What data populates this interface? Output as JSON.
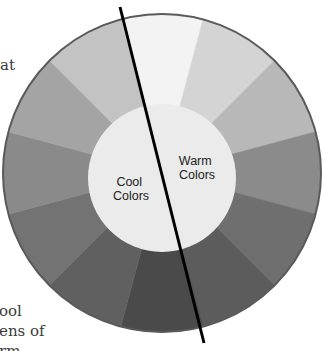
{
  "diagram": {
    "center": {
      "x": 162,
      "y": 173
    },
    "outer_radius": 159,
    "inner_circle": {
      "cx": 162,
      "cy": 178,
      "r": 74,
      "fill": "#ebebeb"
    },
    "rim_color": "#5a5a5a",
    "divider_line": {
      "x1": 120,
      "y1": 7,
      "x2": 204,
      "y2": 343,
      "color": "#000000"
    },
    "labels": {
      "cool": {
        "line1": "Cool",
        "line2": "Colors"
      },
      "warm": {
        "line1": "Warm",
        "line2": "Colors"
      }
    },
    "segments": [
      {
        "start_deg": -15,
        "end_deg": 15,
        "fill": "#f3f3f3"
      },
      {
        "start_deg": 15,
        "end_deg": 45,
        "fill": "#d4d4d4"
      },
      {
        "start_deg": 45,
        "end_deg": 75,
        "fill": "#b8b8b8"
      },
      {
        "start_deg": 75,
        "end_deg": 105,
        "fill": "#8b8b8b"
      },
      {
        "start_deg": 105,
        "end_deg": 135,
        "fill": "#6f6f6f"
      },
      {
        "start_deg": 135,
        "end_deg": 165,
        "fill": "#5c5c5c"
      },
      {
        "start_deg": 165,
        "end_deg": 195,
        "fill": "#4a4a4a"
      },
      {
        "start_deg": 195,
        "end_deg": 225,
        "fill": "#606060"
      },
      {
        "start_deg": 225,
        "end_deg": 255,
        "fill": "#737373"
      },
      {
        "start_deg": 255,
        "end_deg": 285,
        "fill": "#8a8a8a"
      },
      {
        "start_deg": 285,
        "end_deg": 315,
        "fill": "#a4a4a4"
      },
      {
        "start_deg": 315,
        "end_deg": 345,
        "fill": "#c3c3c3"
      }
    ]
  },
  "side_text": {
    "top_fragment": "at",
    "bottom_fragments": [
      "ool",
      "ens of",
      "rm"
    ]
  }
}
